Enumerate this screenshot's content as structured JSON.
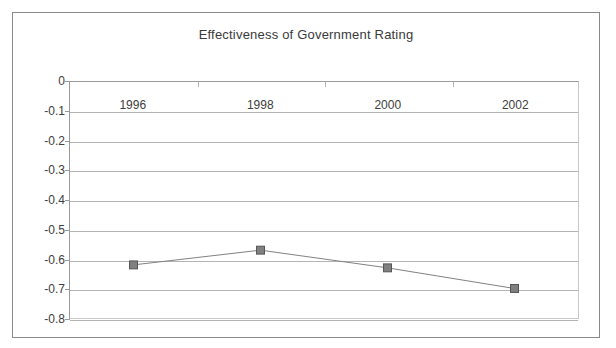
{
  "chart_data": {
    "type": "line",
    "title": "Effectiveness of Government Rating",
    "xlabel": "",
    "ylabel": "",
    "categories": [
      "1996",
      "1998",
      "2000",
      "2002"
    ],
    "values": [
      -0.62,
      -0.57,
      -0.63,
      -0.7
    ],
    "series": [
      {
        "name": "Effectiveness of Government Rating",
        "values": [
          -0.62,
          -0.57,
          -0.63,
          -0.7
        ]
      }
    ],
    "ylim": [
      -0.8,
      0
    ],
    "ytick_labels": [
      "0",
      "-0.1",
      "-0.2",
      "-0.3",
      "-0.4",
      "-0.5",
      "-0.6",
      "-0.7",
      "-0.8"
    ],
    "ytick_values": [
      0,
      -0.1,
      -0.2,
      -0.3,
      -0.4,
      -0.5,
      -0.6,
      -0.7,
      -0.8
    ],
    "grid": true,
    "legend": false,
    "legend_position": "none",
    "marker": "square",
    "colors": {
      "line": "#808080",
      "marker_fill": "#808080",
      "marker_stroke": "#555555",
      "gridline": "#b4b4b4",
      "axis": "#9a9a9a",
      "frame": "#8a8a8a",
      "text": "#404040",
      "title_text": "#3a3a3a",
      "background": "#ffffff"
    }
  }
}
